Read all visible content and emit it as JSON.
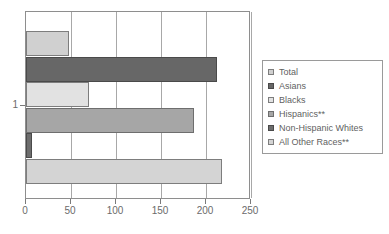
{
  "chart_data": {
    "type": "bar",
    "orientation": "horizontal",
    "title": "",
    "xlabel": "",
    "ylabel": "",
    "categories": [
      "1"
    ],
    "xlim": [
      0,
      250
    ],
    "xticks": [
      0,
      50,
      100,
      150,
      200,
      250
    ],
    "yticks": [
      "1"
    ],
    "grid": "vertical",
    "legend_position": "right",
    "series": [
      {
        "name": "Total",
        "values": [
          48
        ],
        "color": "#d0d0d0",
        "border": "#7d7d7d"
      },
      {
        "name": "Asians",
        "values": [
          212
        ],
        "color": "#676767",
        "border": "#4a4a4a"
      },
      {
        "name": "Blacks",
        "values": [
          70
        ],
        "color": "#e2e2e2",
        "border": "#7d7d7d"
      },
      {
        "name": "Hispanics**",
        "values": [
          187
        ],
        "color": "#a6a6a6",
        "border": "#6e6e6e"
      },
      {
        "name": "Non-Hispanic Whites",
        "values": [
          7
        ],
        "color": "#6d6d6d",
        "border": "#4a4a4a"
      },
      {
        "name": "All Other Races**",
        "values": [
          218
        ],
        "color": "#d4d4d4",
        "border": "#7d7d7d"
      }
    ]
  },
  "axis": {
    "x_tick_labels": [
      "0",
      "50",
      "100",
      "150",
      "200",
      "250"
    ],
    "y_tick_labels": [
      "1"
    ]
  },
  "legend": {
    "entries": [
      {
        "label": "Total"
      },
      {
        "label": "Asians"
      },
      {
        "label": "Blacks"
      },
      {
        "label": "Hispanics**"
      },
      {
        "label": "Non-Hispanic Whites"
      },
      {
        "label": "All Other Races**"
      }
    ]
  },
  "colors": {
    "frame": "#8e8e8e",
    "gridline": "#a8a8a8",
    "text": "#5f5f5f",
    "background": "#ffffff"
  }
}
